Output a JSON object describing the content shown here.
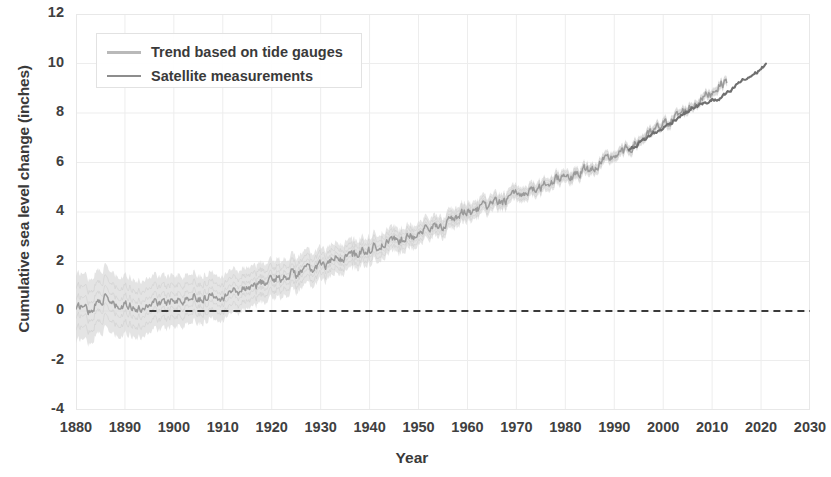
{
  "chart_data": {
    "type": "line",
    "title": "",
    "xlabel": "Year",
    "ylabel": "Cumulative sea level change (inches)",
    "xlim": [
      1880,
      2030
    ],
    "ylim": [
      -4,
      12
    ],
    "xticks": [
      1880,
      1890,
      1900,
      1910,
      1920,
      1930,
      1940,
      1950,
      1960,
      1970,
      1980,
      1990,
      2000,
      2010,
      2020,
      2030
    ],
    "yticks": [
      -4,
      -2,
      0,
      2,
      4,
      6,
      8,
      10,
      12
    ],
    "grid": true,
    "legend_position": "top-left",
    "legend": [
      {
        "name": "Trend based on tide gauges",
        "swatch": "band",
        "color": "#b9b9b9"
      },
      {
        "name": "Satellite measurements",
        "swatch": "sat",
        "color": "#8d8d8d"
      }
    ],
    "reference_line": {
      "value": 0,
      "style": "dashed",
      "color": "#3a3a3a",
      "x_start": 1895,
      "x_end": 2030
    },
    "series": [
      {
        "name": "Trend based on tide gauges",
        "type": "line_with_uncertainty_band",
        "color": "#9a9a9a",
        "band_color": "#d8d8d8",
        "x": [
          1880,
          1881,
          1882,
          1883,
          1884,
          1885,
          1886,
          1887,
          1888,
          1889,
          1890,
          1891,
          1892,
          1893,
          1894,
          1895,
          1896,
          1897,
          1898,
          1899,
          1900,
          1901,
          1902,
          1903,
          1904,
          1905,
          1906,
          1907,
          1908,
          1909,
          1910,
          1911,
          1912,
          1913,
          1914,
          1915,
          1916,
          1917,
          1918,
          1919,
          1920,
          1921,
          1922,
          1923,
          1924,
          1925,
          1926,
          1927,
          1928,
          1929,
          1930,
          1931,
          1932,
          1933,
          1934,
          1935,
          1936,
          1937,
          1938,
          1939,
          1940,
          1941,
          1942,
          1943,
          1944,
          1945,
          1946,
          1947,
          1948,
          1949,
          1950,
          1951,
          1952,
          1953,
          1954,
          1955,
          1956,
          1957,
          1958,
          1959,
          1960,
          1961,
          1962,
          1963,
          1964,
          1965,
          1966,
          1967,
          1968,
          1969,
          1970,
          1971,
          1972,
          1973,
          1974,
          1975,
          1976,
          1977,
          1978,
          1979,
          1980,
          1981,
          1982,
          1983,
          1984,
          1985,
          1986,
          1987,
          1988,
          1989,
          1990,
          1991,
          1992,
          1993,
          1994,
          1995,
          1996,
          1997,
          1998,
          1999,
          2000,
          2001,
          2002,
          2003,
          2004,
          2005,
          2006,
          2007,
          2008,
          2009,
          2010,
          2011,
          2012,
          2013
        ],
        "y": [
          0.0,
          0.22,
          0.14,
          -0.02,
          0.3,
          0.45,
          0.52,
          0.36,
          0.18,
          0.08,
          0.22,
          0.3,
          0.12,
          0.05,
          0.18,
          0.3,
          0.42,
          0.35,
          0.28,
          0.4,
          0.55,
          0.48,
          0.4,
          0.52,
          0.62,
          0.55,
          0.48,
          0.6,
          0.72,
          0.66,
          0.6,
          0.72,
          0.85,
          0.78,
          0.9,
          1.02,
          0.95,
          1.05,
          1.18,
          1.12,
          1.25,
          1.38,
          1.3,
          1.42,
          1.55,
          1.48,
          1.6,
          1.72,
          1.65,
          1.78,
          1.9,
          1.85,
          1.98,
          2.1,
          2.05,
          2.18,
          2.3,
          2.25,
          2.38,
          2.5,
          2.45,
          2.58,
          2.7,
          2.65,
          2.78,
          2.9,
          2.85,
          2.98,
          3.1,
          3.05,
          3.18,
          3.3,
          3.25,
          3.38,
          3.5,
          3.45,
          3.58,
          3.7,
          3.8,
          3.95,
          4.05,
          4.0,
          4.12,
          4.25,
          4.18,
          4.3,
          4.42,
          4.38,
          4.5,
          4.62,
          4.75,
          4.7,
          4.82,
          4.95,
          4.88,
          5.0,
          5.12,
          5.2,
          5.32,
          5.45,
          5.55,
          5.48,
          5.4,
          5.6,
          5.75,
          5.7,
          5.82,
          5.95,
          6.05,
          6.15,
          6.28,
          6.35,
          6.45,
          6.55,
          6.7,
          6.85,
          7.0,
          7.1,
          7.25,
          7.4,
          7.55,
          7.65,
          7.78,
          7.9,
          8.05,
          8.15,
          8.3,
          8.45,
          8.6,
          8.75,
          8.85,
          9.05,
          9.2,
          9.3
        ],
        "y_upper_offset_start": 1.35,
        "y_upper_offset_end": 0.18,
        "note": "shaded 1-sigma band widest at 1880 (~±1.4 in) narrowing to ~±0.2 in by 2013"
      },
      {
        "name": "Satellite measurements",
        "type": "line",
        "color": "#6f6f6f",
        "x": [
          1993,
          1994,
          1995,
          1996,
          1997,
          1998,
          1999,
          2000,
          2001,
          2002,
          2003,
          2004,
          2005,
          2006,
          2007,
          2008,
          2009,
          2010,
          2011,
          2012,
          2013,
          2014,
          2015,
          2016,
          2017,
          2018,
          2019,
          2020,
          2021
        ],
        "y": [
          6.5,
          6.62,
          6.78,
          6.9,
          7.05,
          7.18,
          7.25,
          7.4,
          7.52,
          7.68,
          7.82,
          7.95,
          8.05,
          8.2,
          8.28,
          8.35,
          8.42,
          8.55,
          8.48,
          8.62,
          8.78,
          8.9,
          9.15,
          9.3,
          9.38,
          9.5,
          9.62,
          9.8,
          9.95
        ]
      }
    ]
  }
}
